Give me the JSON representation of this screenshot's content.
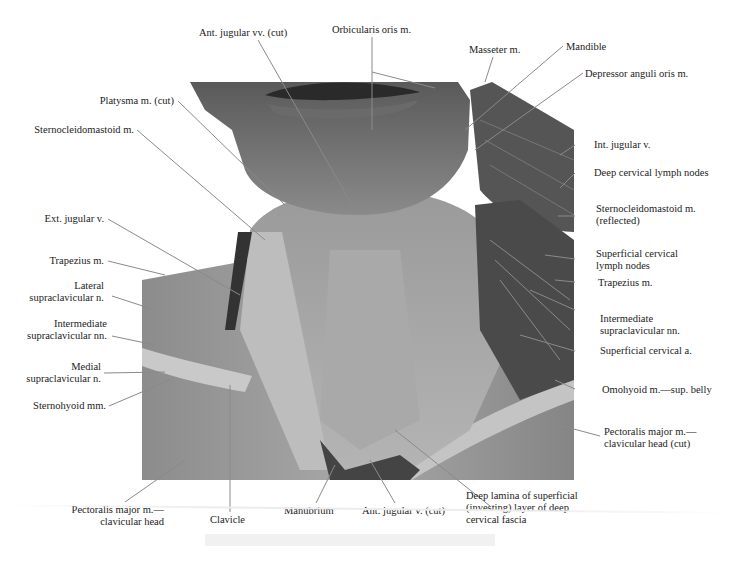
{
  "figure": {
    "colors": {
      "background": "#ffffff",
      "label_text": "#222222",
      "leader_line": "#8a8a8a",
      "tissue_dark": "#3a3a3a",
      "tissue_mid": "#7a7a7a",
      "tissue_light": "#c8c8c8"
    },
    "labels_top": [
      {
        "id": "ant-jugular-vv-cut",
        "text": "Ant. jugular vv. (cut)"
      },
      {
        "id": "orbicularis-oris",
        "text": "Orbicularis oris m."
      },
      {
        "id": "masseter",
        "text": "Masseter m."
      },
      {
        "id": "mandible",
        "text": "Mandible"
      },
      {
        "id": "depressor-anguli-oris",
        "text": "Depressor anguli oris m."
      }
    ],
    "labels_left": [
      {
        "id": "platysma-cut",
        "text": "Platysma m. (cut)"
      },
      {
        "id": "sternocleidomastoid",
        "text": "Sternocleidomastoid m."
      },
      {
        "id": "ext-jugular-v",
        "text": "Ext. jugular v."
      },
      {
        "id": "trapezius-left",
        "text": "Trapezius m."
      },
      {
        "id": "lateral-supraclavicular",
        "text": "Lateral\nsupraclavicular n."
      },
      {
        "id": "intermediate-supraclavicular-left",
        "text": "Intermediate\nsupraclavicular nn."
      },
      {
        "id": "medial-supraclavicular",
        "text": "Medial\nsupraclavicular n."
      },
      {
        "id": "sternohyoid",
        "text": "Sternohyoid mm."
      }
    ],
    "labels_right": [
      {
        "id": "int-jugular-v",
        "text": "Int. jugular v."
      },
      {
        "id": "deep-cervical-lymph",
        "text": "Deep cervical lymph nodes"
      },
      {
        "id": "scm-reflected",
        "text": "Sternocleidomastoid m.\n(reflected)"
      },
      {
        "id": "superficial-cervical-lymph",
        "text": "Superficial cervical\nlymph nodes"
      },
      {
        "id": "trapezius-right",
        "text": "Trapezius m."
      },
      {
        "id": "intermediate-supraclavicular-right",
        "text": "Intermediate\nsupraclavicular nn."
      },
      {
        "id": "superficial-cervical-a",
        "text": "Superficial cervical a."
      },
      {
        "id": "omohyoid",
        "text": "Omohyoid m.—sup. belly"
      },
      {
        "id": "pectoralis-cut",
        "text": "Pectoralis major m.—\nclavicular head (cut)"
      }
    ],
    "labels_bottom": [
      {
        "id": "pectoralis-clavicular",
        "text": "Pectoralis major m.—\nclavicular head"
      },
      {
        "id": "clavicle",
        "text": "Clavicle"
      },
      {
        "id": "manubrium",
        "text": "Manubrium"
      },
      {
        "id": "ant-jugular-v-cut",
        "text": "Ant. jugular v. (cut)"
      },
      {
        "id": "deep-lamina",
        "text": "Deep lamina of superficial\n(investing) layer of deep\ncervical fascia"
      }
    ]
  }
}
